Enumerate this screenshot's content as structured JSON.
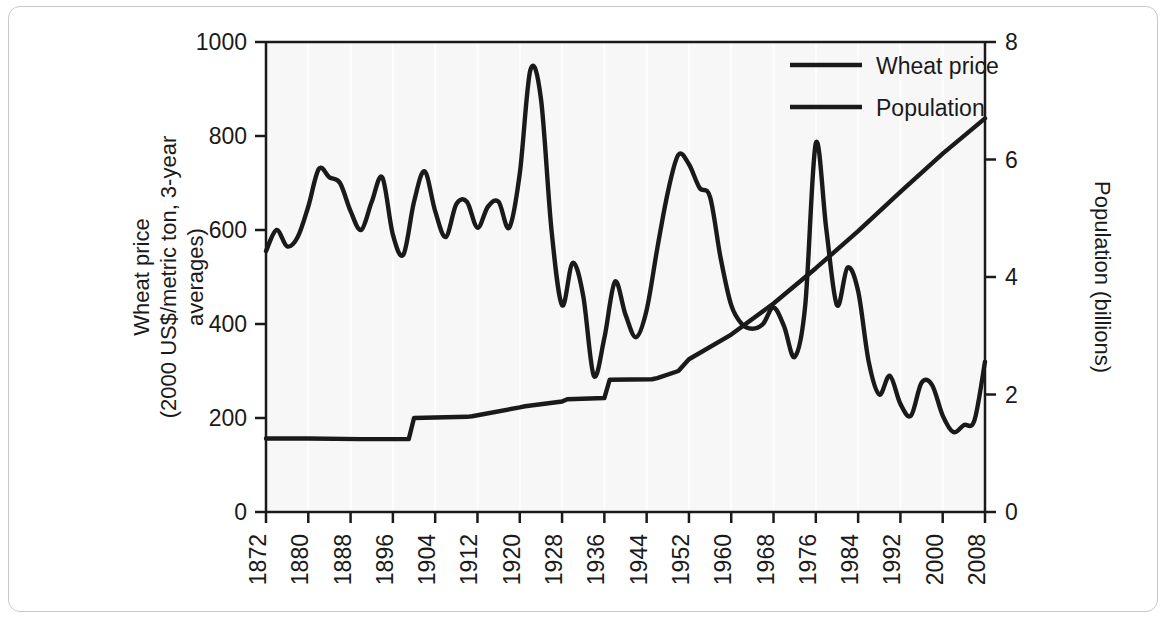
{
  "figure": {
    "border_color": "#c9c9c9",
    "plot_bg": "#f7f7f7",
    "line_color": "#1a1a1a"
  },
  "chart_data": {
    "type": "line",
    "title": "",
    "xlabel": "",
    "ylabel": "Wheat price\n(2000 US$/metric ton, 3-year\naverages)",
    "ylabel_lines": [
      "Wheat price",
      "(2000 US$/metric ton, 3-year",
      "averages)"
    ],
    "y2label": "Population (billions)",
    "xlim": [
      1872,
      2008
    ],
    "ylim": [
      0,
      1000
    ],
    "y2lim": [
      0,
      8
    ],
    "grid": false,
    "legend_position": "top-right",
    "xticks": [
      1872,
      1880,
      1888,
      1896,
      1904,
      1912,
      1920,
      1928,
      1936,
      1944,
      1952,
      1960,
      1968,
      1976,
      1984,
      1992,
      2000,
      2008
    ],
    "xticklabels": [
      "1872",
      "1880",
      "1888",
      "1896",
      "1904",
      "1912",
      "1920",
      "1928",
      "1936",
      "1944",
      "1952",
      "1960",
      "1968",
      "1976",
      "1984",
      "1992",
      "2000",
      "2008"
    ],
    "yticks": [
      0,
      200,
      400,
      600,
      800,
      1000
    ],
    "yticklabels": [
      "0",
      "200",
      "400",
      "600",
      "800",
      "1000"
    ],
    "y2ticks": [
      0,
      2,
      4,
      6,
      8
    ],
    "y2ticklabels": [
      "0",
      "2",
      "4",
      "6",
      "8"
    ],
    "series": [
      {
        "name": "Wheat price",
        "axis": "left",
        "units": "2000 US$/metric ton",
        "x": [
          1872,
          1874,
          1876,
          1878,
          1880,
          1882,
          1884,
          1886,
          1888,
          1890,
          1892,
          1894,
          1896,
          1898,
          1900,
          1902,
          1904,
          1906,
          1908,
          1910,
          1912,
          1914,
          1916,
          1918,
          1920,
          1922,
          1924,
          1926,
          1928,
          1930,
          1932,
          1934,
          1936,
          1938,
          1940,
          1942,
          1944,
          1946,
          1948,
          1950,
          1952,
          1954,
          1956,
          1958,
          1960,
          1962,
          1964,
          1966,
          1968,
          1970,
          1972,
          1974,
          1976,
          1978,
          1980,
          1982,
          1984,
          1986,
          1988,
          1990,
          1992,
          1994,
          1996,
          1998,
          2000,
          2002,
          2004,
          2006,
          2008
        ],
        "y": [
          555,
          600,
          565,
          585,
          650,
          730,
          712,
          700,
          640,
          600,
          660,
          712,
          590,
          548,
          660,
          725,
          640,
          585,
          655,
          660,
          605,
          650,
          660,
          605,
          720,
          940,
          880,
          600,
          440,
          530,
          460,
          290,
          370,
          490,
          420,
          372,
          430,
          560,
          680,
          760,
          740,
          690,
          670,
          540,
          440,
          400,
          390,
          400,
          435,
          395,
          330,
          440,
          785,
          600,
          440,
          520,
          470,
          320,
          250,
          290,
          230,
          205,
          275,
          270,
          205,
          170,
          185,
          195,
          320
        ]
      },
      {
        "name": "Population",
        "axis": "right",
        "units": "billions",
        "x": [
          1872,
          1880,
          1890,
          1899,
          1900,
          1910,
          1911,
          1920,
          1921,
          1928,
          1929,
          1936,
          1937,
          1945,
          1946,
          1950,
          1952,
          1960,
          1968,
          1976,
          1984,
          1992,
          2000,
          2008
        ],
        "y": [
          1.25,
          1.25,
          1.24,
          1.24,
          1.6,
          1.62,
          1.63,
          1.78,
          1.8,
          1.88,
          1.92,
          1.94,
          2.25,
          2.26,
          2.28,
          2.4,
          2.6,
          3.02,
          3.55,
          4.15,
          4.78,
          5.45,
          6.1,
          6.7
        ]
      }
    ],
    "legend": [
      {
        "label": "Wheat price",
        "color": "#1a1a1a"
      },
      {
        "label": "Population",
        "color": "#1a1a1a"
      }
    ]
  }
}
